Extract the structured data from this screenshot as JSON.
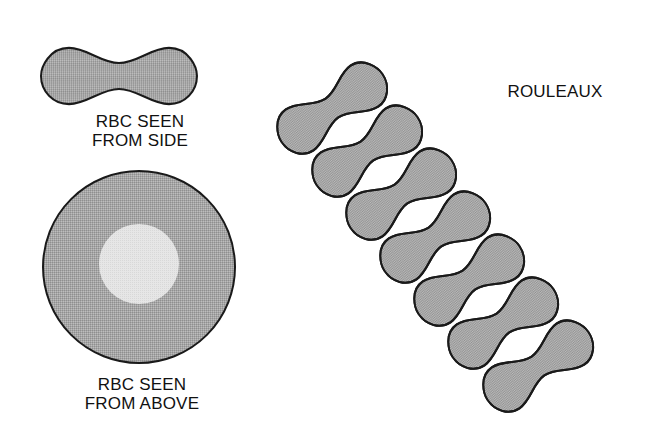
{
  "figure": {
    "colors": {
      "cell_fill": "#a9a9a9",
      "cell_center_fill": "#e4e4e4",
      "outline": "#1a1a1a",
      "background": "#ffffff",
      "text": "#111111"
    },
    "side_view": {
      "label_line1": "RBC SEEN",
      "label_line2": "FROM SIDE"
    },
    "top_view": {
      "label_line1": "RBC SEEN",
      "label_line2": "FROM ABOVE"
    },
    "rouleaux": {
      "label": "ROULEAUX",
      "cell_count": 7
    }
  }
}
